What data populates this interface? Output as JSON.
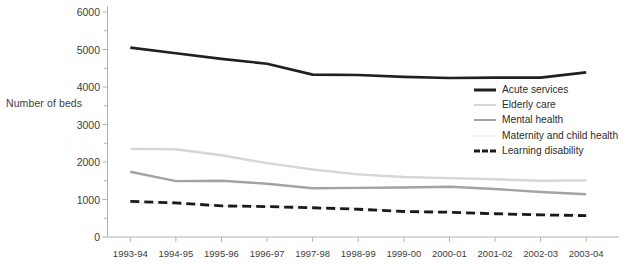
{
  "chart_data": {
    "type": "line",
    "title": "",
    "xlabel": "",
    "ylabel": "Number of beds",
    "ylim": [
      0,
      6000
    ],
    "ytick_values": [
      0,
      1000,
      2000,
      3000,
      4000,
      5000,
      6000
    ],
    "ytick_labels": [
      "0",
      "1000",
      "2000",
      "3000",
      "4000",
      "5000",
      "6000"
    ],
    "yminor_tick_values": [
      500,
      1500,
      2500,
      3500,
      4500,
      5500
    ],
    "grid": false,
    "legend_position": "center-right",
    "categories": [
      "1993-94",
      "1994-95",
      "1995-96",
      "1996-97",
      "1997-98",
      "1998-99",
      "1999-00",
      "2000-01",
      "2001-02",
      "2002-03",
      "2003-04"
    ],
    "series": [
      {
        "name": "Acute services",
        "color": "#231f20",
        "style": "solid",
        "width": 2.6,
        "values": [
          5050,
          4900,
          4750,
          4620,
          4330,
          4320,
          4270,
          4240,
          4250,
          4250,
          4390
        ]
      },
      {
        "name": "Elderly care",
        "color": "#d6d6d6",
        "style": "solid",
        "width": 2.4,
        "values": [
          2350,
          2340,
          2180,
          1970,
          1800,
          1670,
          1600,
          1570,
          1540,
          1500,
          1510
        ]
      },
      {
        "name": "Mental health",
        "color": "#a3a3a3",
        "style": "solid",
        "width": 2.4,
        "values": [
          1740,
          1490,
          1500,
          1420,
          1300,
          1310,
          1320,
          1340,
          1280,
          1200,
          1140
        ]
      },
      {
        "name": "Maternity and child health",
        "color": "#f2f2f2",
        "style": "solid",
        "width": 2.2,
        "values": [
          900,
          890,
          830,
          820,
          790,
          760,
          700,
          670,
          640,
          610,
          580
        ]
      },
      {
        "name": "Learning disability",
        "color": "#1a1a1a",
        "style": "dashed",
        "width": 2.8,
        "values": [
          950,
          910,
          830,
          810,
          780,
          740,
          680,
          660,
          620,
          590,
          570
        ]
      }
    ]
  },
  "axis": {
    "axis_color": "#b3b3b3",
    "tick_color": "#b3b3b3",
    "text_color": "#3d3d3d"
  }
}
